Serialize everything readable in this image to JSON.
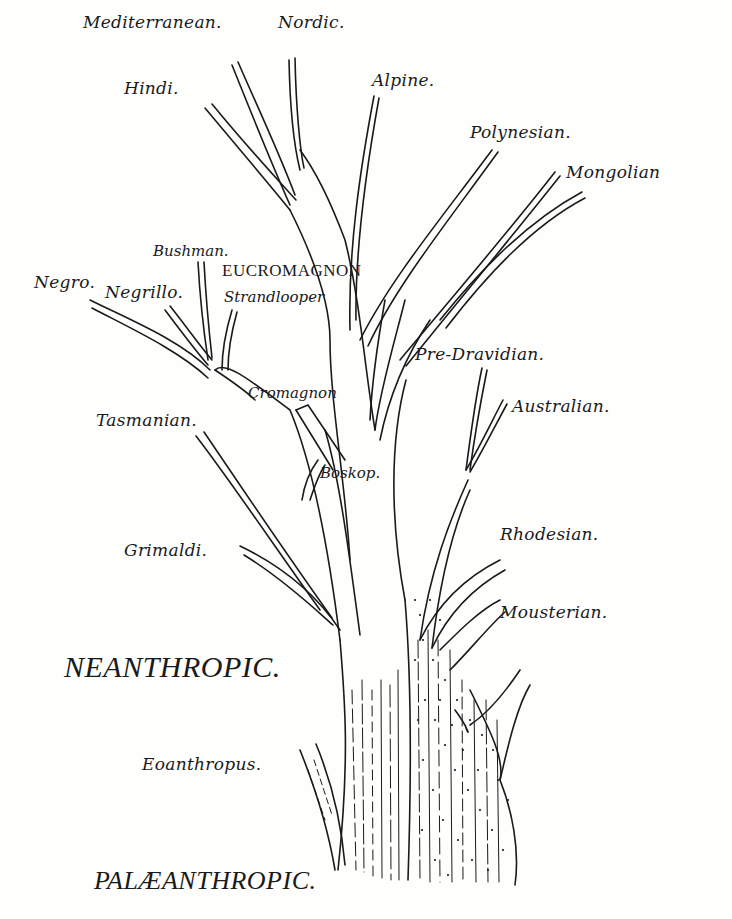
{
  "diagram": {
    "type": "phylogenetic tree of human races (hand-drawn illustration)",
    "stages": {
      "upper": "NEANTHROPIC.",
      "lower": "PALÆANTHROPIC."
    },
    "nodes": {
      "mediterranean": "Mediterranean.",
      "nordic": "Nordic.",
      "hindi": "Hindi.",
      "alpine": "Alpine.",
      "polynesian": "Polynesian.",
      "mongolian": "Mongolian",
      "bushman": "Bushman.",
      "eucromagnon": "EUCROMAGNON",
      "negro": "Negro.",
      "negrillo": "Negrillo.",
      "strandlooper": "Strandlooper",
      "pre_dravidian": "Pre-Dravidian.",
      "cromagnon": "Cromagnon",
      "australian": "Australian.",
      "tasmanian": "Tasmanian.",
      "boskop": "Boskop.",
      "grimaldi": "Grimaldi.",
      "rhodesian": "Rhodesian.",
      "mousterian": "Mousterian.",
      "eoanthropus": "Eoanthropus."
    },
    "colors": {
      "ink": "#1a1a1a",
      "paper": "#fefefd"
    }
  }
}
